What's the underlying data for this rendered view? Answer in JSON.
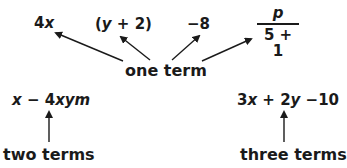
{
  "diagram": {
    "top_row": {
      "examples": [
        {
          "id": "term-4x",
          "text": "4x"
        },
        {
          "id": "term-y-plus-2",
          "text": "(y + 2)"
        },
        {
          "id": "term-minus-8",
          "text": "−8"
        },
        {
          "id": "term-fraction",
          "numerator": "p",
          "denominator": "5 + 1"
        }
      ],
      "label": "one term"
    },
    "bottom_left": {
      "expression": "x − 4xym",
      "label": "two terms"
    },
    "bottom_right": {
      "expression": "3x + 2y −10",
      "label": "three terms"
    },
    "colors": {
      "text": "#1a1a1a",
      "arrow": "#1a1a1a",
      "background": "#ffffff"
    }
  }
}
